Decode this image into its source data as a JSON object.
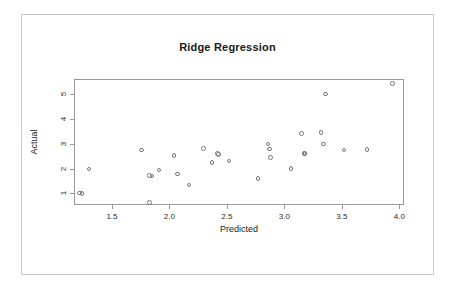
{
  "chart_data": {
    "type": "scatter",
    "title": "Ridge Regression",
    "xlabel": "Predicted",
    "ylabel": "Actual",
    "xlim": [
      1.17,
      4.04
    ],
    "ylim": [
      0.53,
      5.62
    ],
    "xticks": [
      1.5,
      2.0,
      2.5,
      3.0,
      3.5,
      4.0
    ],
    "xticklabels": [
      "1.5",
      "2.0",
      "2.5",
      "3.0",
      "3.5",
      "4.0"
    ],
    "yticks": [
      1,
      2,
      3,
      4,
      5
    ],
    "yticklabels": [
      "1",
      "2",
      "3",
      "4",
      "5"
    ],
    "grid": false,
    "legend": null,
    "marker": "open-circle",
    "marker_color": "#7a7a7a",
    "points": [
      {
        "x": 1.21,
        "y": 1.05
      },
      {
        "x": 1.23,
        "y": 1.04
      },
      {
        "x": 1.29,
        "y": 2.02
      },
      {
        "x": 1.75,
        "y": 2.79
      },
      {
        "x": 1.82,
        "y": 1.76
      },
      {
        "x": 1.84,
        "y": 1.74
      },
      {
        "x": 1.82,
        "y": 0.68
      },
      {
        "x": 1.9,
        "y": 1.99
      },
      {
        "x": 2.03,
        "y": 2.58
      },
      {
        "x": 2.06,
        "y": 1.82
      },
      {
        "x": 2.16,
        "y": 1.38
      },
      {
        "x": 2.29,
        "y": 2.86
      },
      {
        "x": 2.36,
        "y": 2.28
      },
      {
        "x": 2.41,
        "y": 2.64
      },
      {
        "x": 2.42,
        "y": 2.6
      },
      {
        "x": 2.51,
        "y": 2.35
      },
      {
        "x": 2.76,
        "y": 1.63
      },
      {
        "x": 2.85,
        "y": 3.04
      },
      {
        "x": 2.86,
        "y": 2.83
      },
      {
        "x": 2.87,
        "y": 2.5
      },
      {
        "x": 3.05,
        "y": 2.04
      },
      {
        "x": 3.14,
        "y": 3.45
      },
      {
        "x": 3.16,
        "y": 2.66
      },
      {
        "x": 3.17,
        "y": 2.65
      },
      {
        "x": 3.31,
        "y": 3.5
      },
      {
        "x": 3.33,
        "y": 3.04
      },
      {
        "x": 3.35,
        "y": 5.06
      },
      {
        "x": 3.51,
        "y": 2.8
      },
      {
        "x": 3.71,
        "y": 2.82
      },
      {
        "x": 3.93,
        "y": 5.48
      }
    ]
  }
}
